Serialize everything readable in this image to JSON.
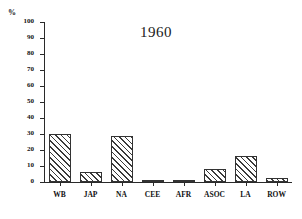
{
  "chart_data": {
    "type": "bar",
    "title": "1960",
    "xlabel": "",
    "ylabel": "%",
    "ylim": [
      0,
      100
    ],
    "ytick_labels": [
      "0",
      "10",
      "20",
      "30",
      "40",
      "50",
      "60",
      "70",
      "80",
      "90",
      "100"
    ],
    "ytick_values": [
      0,
      10,
      20,
      30,
      40,
      50,
      60,
      70,
      80,
      90,
      100
    ],
    "grid": false,
    "legend": false,
    "categories": [
      "WB",
      "JAP",
      "NA",
      "CEE",
      "AFR",
      "ASOC",
      "LA",
      "ROW"
    ],
    "values": [
      30,
      6,
      29,
      0.5,
      1.5,
      8,
      16,
      2.5
    ],
    "bar_fill": "diagonal-hatch",
    "bar_edge_color": "#333333",
    "axis_color": "#2a2a2a"
  },
  "axis": {
    "unit_label": "%"
  }
}
